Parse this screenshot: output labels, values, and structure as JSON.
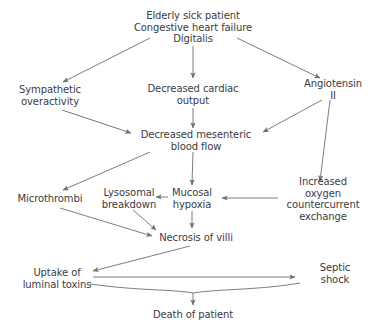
{
  "diagram": {
    "background_color": "#ffffff",
    "text_color": "#3b3b3f",
    "edge_color": "#6e6e73",
    "nodes": [
      {
        "id": "trigger",
        "label": "Elderly sick patient\nCongestive heart failure\nDigitalis",
        "x": 193,
        "y": 27
      },
      {
        "id": "sympathetic",
        "label": "Sympathetic\noveractivity",
        "x": 50,
        "y": 95
      },
      {
        "id": "cardiac",
        "label": "Decreased cardiac\noutput",
        "x": 193,
        "y": 94
      },
      {
        "id": "angiotensin",
        "label": "Angiotensin II",
        "x": 333,
        "y": 89
      },
      {
        "id": "mesenteric",
        "label": "Decreased mesenteric\nblood flow",
        "x": 196,
        "y": 140
      },
      {
        "id": "microthrombi",
        "label": "Microthrombi",
        "x": 50,
        "y": 199
      },
      {
        "id": "lysosomal",
        "label": "Lysosomal\nbreakdown",
        "x": 129,
        "y": 198
      },
      {
        "id": "mucosal",
        "label": "Mucosal\nhypoxia",
        "x": 192,
        "y": 198
      },
      {
        "id": "oxygen",
        "label": "Increased oxygen\ncountercurrent\nexchange",
        "x": 323,
        "y": 199
      },
      {
        "id": "necrosis",
        "label": "Necrosis of villi",
        "x": 196,
        "y": 238
      },
      {
        "id": "uptake",
        "label": "Uptake of\nluminal toxins",
        "x": 57,
        "y": 278
      },
      {
        "id": "septic",
        "label": "Septic shock",
        "x": 335,
        "y": 273
      },
      {
        "id": "death",
        "label": "Death of patient",
        "x": 193,
        "y": 315
      }
    ],
    "edges": [
      {
        "from": "trigger",
        "to": "sympathetic"
      },
      {
        "from": "trigger",
        "to": "cardiac"
      },
      {
        "from": "trigger",
        "to": "angiotensin"
      },
      {
        "from": "sympathetic",
        "to": "mesenteric"
      },
      {
        "from": "cardiac",
        "to": "mesenteric"
      },
      {
        "from": "angiotensin",
        "to": "mesenteric"
      },
      {
        "from": "angiotensin",
        "to": "oxygen"
      },
      {
        "from": "mesenteric",
        "to": "microthrombi"
      },
      {
        "from": "mesenteric",
        "to": "mucosal"
      },
      {
        "from": "oxygen",
        "to": "mucosal"
      },
      {
        "from": "mucosal",
        "to": "lysosomal"
      },
      {
        "from": "microthrombi",
        "to": "necrosis"
      },
      {
        "from": "lysosomal",
        "to": "necrosis"
      },
      {
        "from": "mucosal",
        "to": "necrosis"
      },
      {
        "from": "necrosis",
        "to": "uptake"
      },
      {
        "from": "uptake",
        "to": "septic"
      },
      {
        "from": "uptake_septic_bracket",
        "to": "death"
      }
    ]
  }
}
